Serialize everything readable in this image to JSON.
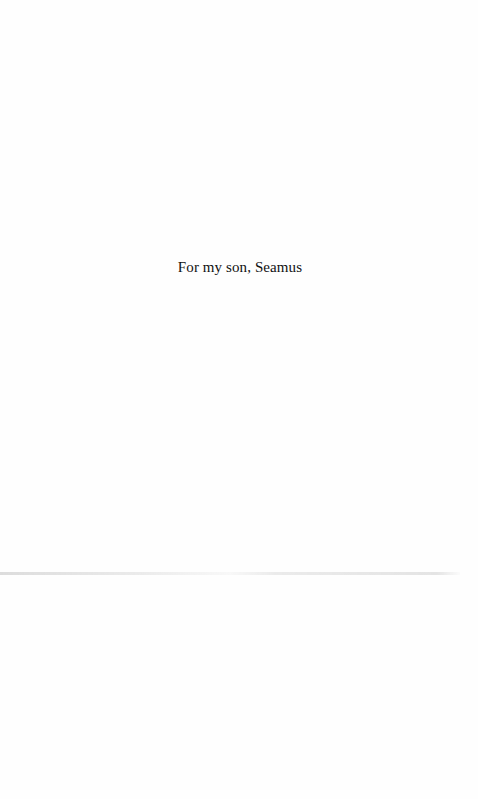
{
  "page": {
    "dedication": "For my son, Seamus"
  }
}
